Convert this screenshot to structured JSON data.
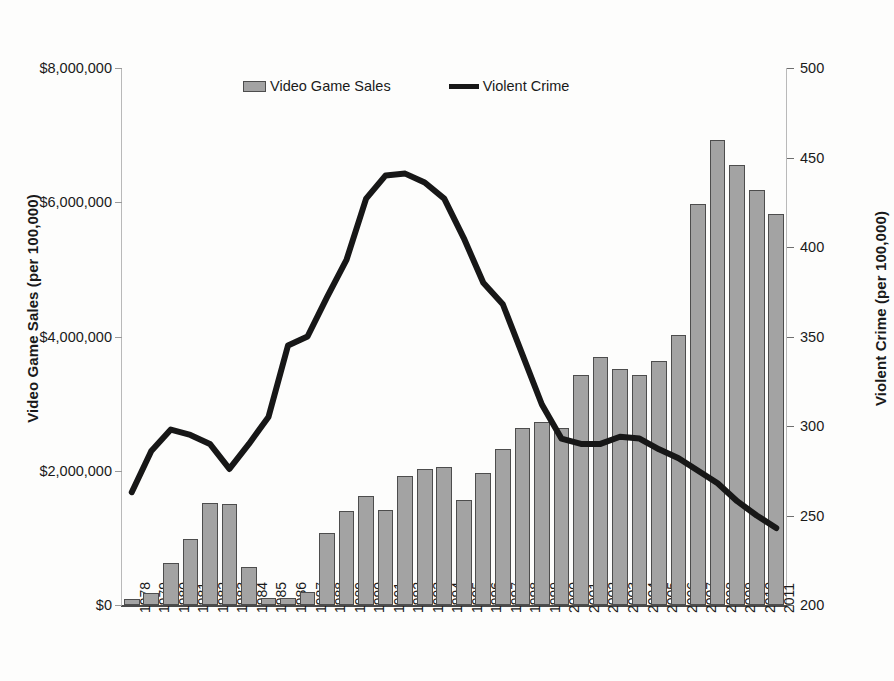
{
  "chart_data": {
    "type": "bar",
    "title": "",
    "xlabel": "",
    "ylabel": "Video Game Sales (per 100,000)",
    "y2label": "Violent Crime (per 100,000)",
    "grid": false,
    "legend_position": "top-center",
    "categories": [
      "1978",
      "1979",
      "1980",
      "1981",
      "1982",
      "1983",
      "1984",
      "1985",
      "1986",
      "1987",
      "1988",
      "1989",
      "1990",
      "1991",
      "1992",
      "1993",
      "1994",
      "1995",
      "1996",
      "1997",
      "1998",
      "1999",
      "2000",
      "2001",
      "2002",
      "2003",
      "2004",
      "2005",
      "2006",
      "2007",
      "2008",
      "2009",
      "2010",
      "2011"
    ],
    "ylim": [
      0,
      8000000
    ],
    "yticks": [
      0,
      2000000,
      4000000,
      6000000,
      8000000
    ],
    "ytick_labels": [
      "$0",
      "$2,000,000",
      "$4,000,000",
      "$6,000,000",
      "$8,000,000"
    ],
    "y2lim": [
      200,
      500
    ],
    "y2ticks": [
      200,
      250,
      300,
      350,
      400,
      450,
      500
    ],
    "y2tick_labels": [
      "200",
      "250",
      "300",
      "350",
      "400",
      "450",
      "500"
    ],
    "series": [
      {
        "name": "Video Game Sales",
        "type": "bar",
        "axis": "left",
        "color": "#a3a3a3",
        "edge_color": "#4d4d4d",
        "values": [
          90000,
          180000,
          620000,
          980000,
          1520000,
          1500000,
          560000,
          100000,
          110000,
          190000,
          1080000,
          1400000,
          1630000,
          1420000,
          1920000,
          2030000,
          2060000,
          1570000,
          1970000,
          2330000,
          2630000,
          2720000,
          2630000,
          3420000,
          3700000,
          3520000,
          3420000,
          3630000,
          4020000,
          5980000,
          6930000,
          6550000,
          6180000,
          5820000
        ]
      },
      {
        "name": "Violent Crime",
        "type": "line",
        "axis": "right",
        "color": "#171717",
        "line_width": 6,
        "values": [
          263,
          286,
          298,
          295,
          290,
          276,
          290,
          305,
          345,
          350,
          372,
          393,
          427,
          440,
          441,
          436,
          427,
          405,
          380,
          368,
          340,
          312,
          293,
          290,
          290,
          294,
          293,
          287,
          282,
          275,
          268,
          258,
          250,
          243
        ]
      }
    ]
  },
  "legend": {
    "entries": [
      {
        "label": "Video Game Sales",
        "marker": "bar-swatch"
      },
      {
        "label": "Violent Crime",
        "marker": "line-swatch"
      }
    ]
  },
  "colors": {
    "bar_fill": "#a3a3a3",
    "bar_edge": "#4d4d4d",
    "line": "#171717",
    "text": "#1a1a1a",
    "background": "#fdfdfc"
  }
}
